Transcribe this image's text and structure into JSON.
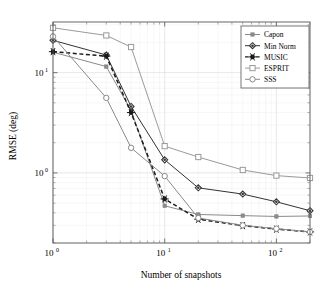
{
  "chart_data": {
    "type": "line",
    "title": "",
    "xlabel": "Number of snapshots",
    "ylabel": "RMSE (deg)",
    "xscale": "log",
    "yscale": "log",
    "xlim": [
      1,
      200
    ],
    "ylim": [
      0.2,
      32
    ],
    "grid": true,
    "legend_position": "top-right",
    "x": [
      1,
      3,
      5,
      10,
      20,
      50,
      100,
      200
    ],
    "xtick_labels": [
      "10^0",
      "10^1",
      "10^2"
    ],
    "xtick_values": [
      1,
      10,
      100
    ],
    "ytick_labels": [
      "10^1",
      "10^0"
    ],
    "ytick_values": [
      10,
      1
    ],
    "series": [
      {
        "name": "Capon",
        "marker": "small-square",
        "color": "#8a8a8a",
        "linestyle": "solid",
        "values": [
          16.0,
          11.5,
          4.2,
          0.47,
          0.385,
          0.375,
          0.368,
          0.372
        ]
      },
      {
        "name": "Min Norm",
        "marker": "diamond",
        "color": "#333333",
        "linestyle": "solid",
        "values": [
          21.0,
          15.0,
          4.6,
          1.35,
          0.71,
          0.615,
          0.515,
          0.42
        ]
      },
      {
        "name": "MUSIC",
        "marker": "star",
        "color": "#1a1a1a",
        "linestyle": "dashed",
        "values": [
          16.2,
          14.6,
          4.0,
          0.55,
          0.345,
          0.298,
          0.275,
          0.258
        ]
      },
      {
        "name": "ESPRIT",
        "marker": "square",
        "color": "#9a9a9a",
        "linestyle": "solid",
        "values": [
          28.0,
          23.5,
          18.0,
          1.85,
          1.44,
          1.07,
          0.94,
          0.89
        ]
      },
      {
        "name": "SSS",
        "marker": "circle",
        "color": "#8a8a8a",
        "linestyle": "solid",
        "values": [
          23.0,
          5.6,
          1.78,
          0.93,
          0.355,
          0.3,
          0.278,
          0.258
        ]
      }
    ]
  },
  "legend": {
    "items": [
      {
        "label": "Capon"
      },
      {
        "label": "Min Norm"
      },
      {
        "label": "MUSIC"
      },
      {
        "label": "ESPRIT"
      },
      {
        "label": "SSS"
      }
    ]
  },
  "axes": {
    "x_title": "Number of snapshots",
    "y_title": "RMSE (deg)",
    "x_ticks": [
      {
        "base": "10",
        "exp": "0"
      },
      {
        "base": "10",
        "exp": "1"
      },
      {
        "base": "10",
        "exp": "2"
      }
    ],
    "y_ticks": [
      {
        "base": "10",
        "exp": "1"
      },
      {
        "base": "10",
        "exp": "0"
      }
    ]
  }
}
